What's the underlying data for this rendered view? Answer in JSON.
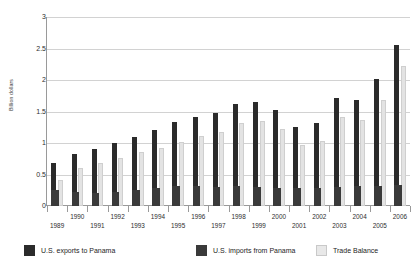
{
  "chart_data": {
    "type": "bar",
    "title": "",
    "subtitle": "",
    "xlabel": "",
    "ylabel": "Billion dollars",
    "ylim": [
      0,
      3
    ],
    "yticks": [
      0,
      0.5,
      1,
      1.5,
      2,
      2.5,
      3
    ],
    "ytick_labels": [
      "0",
      "0.5",
      "1",
      "1.5",
      "2",
      "2.5",
      "3"
    ],
    "grid": true,
    "legend_position": "bottom",
    "categories": [
      "1989",
      "1990",
      "1991",
      "1992",
      "1993",
      "1994",
      "1995",
      "1996",
      "1997",
      "1998",
      "1999",
      "2000",
      "2001",
      "2002",
      "2003",
      "2004",
      "2005",
      "2006"
    ],
    "series": [
      {
        "name": "U.S. exports to Panama",
        "color": "#2b2b2b",
        "values": [
          0.68,
          0.83,
          0.9,
          1.0,
          1.1,
          1.2,
          1.33,
          1.42,
          1.47,
          1.62,
          1.65,
          1.52,
          1.25,
          1.32,
          1.72,
          1.68,
          2.01,
          2.55
        ]
      },
      {
        "name": "U.S. imports from Panama",
        "color": "#3a3a3a",
        "values": [
          0.25,
          0.22,
          0.21,
          0.23,
          0.25,
          0.28,
          0.32,
          0.31,
          0.3,
          0.31,
          0.3,
          0.29,
          0.28,
          0.29,
          0.3,
          0.31,
          0.32,
          0.33
        ]
      },
      {
        "name": "Trade Balance",
        "color": "#e3e3e3",
        "values": [
          0.42,
          0.6,
          0.68,
          0.77,
          0.85,
          0.92,
          1.01,
          1.11,
          1.17,
          1.31,
          1.35,
          1.23,
          0.97,
          1.03,
          1.42,
          1.37,
          1.69,
          2.22
        ]
      }
    ]
  },
  "legend": {
    "items": [
      {
        "label": "U.S. exports to Panama"
      },
      {
        "label": "U.S. imports from Panama"
      },
      {
        "label": "Trade Balance"
      }
    ]
  }
}
